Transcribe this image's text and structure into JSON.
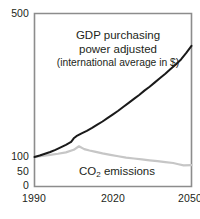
{
  "chart_data": {
    "type": "line",
    "title": "",
    "xlabel": "",
    "ylabel": "",
    "xlim": [
      1990,
      2050
    ],
    "ylim": [
      0,
      500
    ],
    "grid": false,
    "legend_position": "inline-annotation",
    "y_axis_note": "non-linear axis: compressed above 100",
    "xticks": [
      "1990",
      "2020",
      "2050"
    ],
    "xtick_values": [
      1990,
      2020,
      2050
    ],
    "yticks": [
      "500",
      "100",
      "50",
      "0"
    ],
    "ytick_values": [
      500,
      100,
      50,
      0
    ],
    "series": [
      {
        "name": "GDP purchasing power adjusted (international average in $)",
        "short_name": "GDP purchasing power adjusted",
        "color": "#1a1a1a",
        "x": [
          1990,
          1992,
          1994,
          1996,
          1998,
          2000,
          2002,
          2004,
          2005,
          2006,
          2008,
          2010,
          2012,
          2014,
          2016,
          2018,
          2020,
          2022,
          2024,
          2026,
          2028,
          2030,
          2032,
          2034,
          2036,
          2038,
          2040,
          2042,
          2044,
          2046,
          2048,
          2050
        ],
        "values": [
          100,
          104,
          109,
          114,
          120,
          127,
          134,
          142,
          152,
          158,
          166,
          173,
          181,
          190,
          199,
          209,
          219,
          229,
          240,
          251,
          262,
          273,
          285,
          296,
          308,
          320,
          332,
          345,
          358,
          372,
          390,
          410
        ]
      },
      {
        "name": "CO2 emissions",
        "short_name": "CO2 emissions",
        "color": "#c6c6c6",
        "x": [
          1990,
          1993,
          1996,
          1999,
          2002,
          2005,
          2007,
          2009,
          2011,
          2013,
          2016,
          2019,
          2022,
          2025,
          2028,
          2031,
          2034,
          2037,
          2040,
          2043,
          2045,
          2047,
          2050
        ],
        "values": [
          100,
          103,
          106,
          109,
          113,
          120,
          130,
          122,
          118,
          115,
          110,
          106,
          102,
          98,
          95,
          92,
          89,
          86,
          83,
          80,
          76,
          72,
          73
        ]
      }
    ],
    "annotations": [
      {
        "id": "gdp-annotation",
        "lines": [
          "GDP purchasing",
          "power adjusted",
          "(international average in $)"
        ]
      },
      {
        "id": "co2-annotation",
        "text_parts": {
          "prefix": "CO",
          "sub": "2",
          "suffix": " emissions"
        }
      }
    ]
  },
  "axes": {
    "y_ticks": [
      {
        "label": "500",
        "value": 500
      },
      {
        "label": "100",
        "value": 100
      },
      {
        "label": "50",
        "value": 50
      },
      {
        "label": "0",
        "value": 0
      }
    ],
    "x_ticks": [
      {
        "label": "1990",
        "value": 1990
      },
      {
        "label": "2020",
        "value": 2020
      },
      {
        "label": "2050",
        "value": 2050
      }
    ]
  },
  "labels": {
    "gdp_line1": "GDP purchasing",
    "gdp_line2": "power adjusted",
    "gdp_line3": "(international average in $)",
    "co2_prefix": "CO",
    "co2_sub": "2",
    "co2_suffix": " emissions"
  },
  "colors": {
    "gdp_line": "#1a1a1a",
    "co2_line": "#c6c6c6",
    "frame": "#8c8c8c",
    "text": "#231f20",
    "background": "#ffffff"
  }
}
